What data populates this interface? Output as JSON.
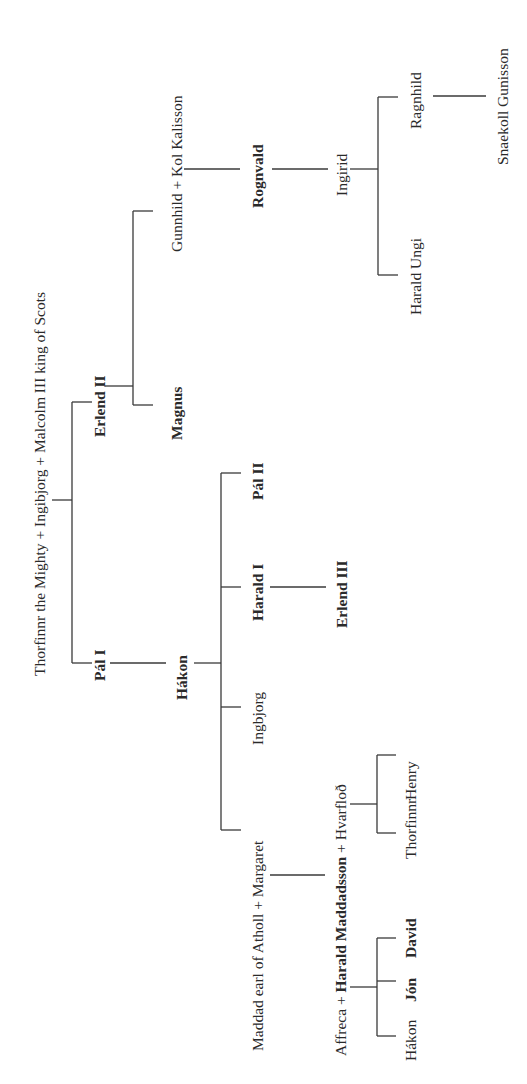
{
  "diagram": {
    "type": "genealogy-tree",
    "orientation": "rotated-90-ccw",
    "line_color": "#3a3a3a",
    "text_color": "#2a2a2a",
    "nodes": {
      "root": "Thorfinnr the Mighty + Ingibjorg + Malcolm III king of Scots",
      "pal_i": "Pál I",
      "erlend_ii": "Erlend II",
      "magnus": "Magnus",
      "gunnhild": "Gunnhild + Kol Kalisson",
      "rognvald": "Rognvald",
      "ingirid": "Ingirid",
      "ragnhild": "Ragnhild",
      "harald_ungi": "Harald Ungi",
      "snaekoll": "Snaekoll Gunisson",
      "hakon": "Hákon",
      "pal_ii": "Pál II",
      "harald_i": "Harald I",
      "erlend_iii": "Erlend III",
      "ingbjorg": "Ingbjorg",
      "maddad_pre": "Maddad earl of Atholl + ",
      "margaret": "Margaret",
      "affreca_pre": "Affreca + ",
      "harald_maddadsson": "Harald Maddadsson",
      "hvarflod_post": " + Hvarfloð",
      "thorfinnr": "Thorfinnr",
      "henry": "Henry",
      "hakon_jr": "Hákon",
      "jon": "Jón",
      "david": "David"
    },
    "bold_nodes": [
      "Pál I",
      "Erlend II",
      "Magnus",
      "Rognvald",
      "Hákon",
      "Pál II",
      "Harald I",
      "Erlend III",
      "Harald Maddadsson",
      "Jón",
      "David"
    ],
    "relationships": [
      {
        "parents": "Thorfinnr the Mighty + Ingibjorg + Malcolm III king of Scots",
        "children": [
          "Pál I",
          "Erlend II"
        ]
      },
      {
        "parents": "Erlend II",
        "children": [
          "Magnus",
          "Gunnhild + Kol Kalisson"
        ]
      },
      {
        "parents": "Gunnhild + Kol Kalisson",
        "children": [
          "Rognvald"
        ]
      },
      {
        "parents": "Rognvald",
        "children": [
          "Ingirid"
        ]
      },
      {
        "parents": "Ingirid",
        "children": [
          "Harald Ungi",
          "Ragnhild"
        ]
      },
      {
        "parents": "Ragnhild",
        "children": [
          "Snaekoll Gunisson"
        ]
      },
      {
        "parents": "Pál I",
        "children": [
          "Hákon"
        ]
      },
      {
        "parents": "Hákon",
        "children": [
          "Margaret",
          "Ingbjorg",
          "Harald I",
          "Pál II"
        ]
      },
      {
        "parents": "Harald I",
        "children": [
          "Erlend III"
        ]
      },
      {
        "parents": "Maddad earl of Atholl + Margaret",
        "children": [
          "Harald Maddadsson"
        ]
      },
      {
        "parents": "Harald Maddadsson + Hvarfloð",
        "children": [
          "Thorfinnr",
          "Henry"
        ]
      },
      {
        "parents": "Affreca + Harald Maddadsson",
        "children": [
          "Hákon",
          "Jón",
          "David"
        ]
      }
    ]
  }
}
